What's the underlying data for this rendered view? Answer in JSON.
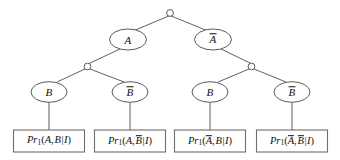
{
  "figure": {
    "kind": "probability-decomposition-tree",
    "background_color": "#ffffff",
    "line_color": "#4f4f4f",
    "text_color": "#111111"
  },
  "root": {
    "name": "root-junction",
    "label": ""
  },
  "level_a": {
    "nodes": [
      {
        "id": "node-a",
        "base": "A",
        "overbar": false
      },
      {
        "id": "node-a-bar",
        "base": "A",
        "overbar": true
      }
    ]
  },
  "junctions": [
    {
      "id": "junction-left"
    },
    {
      "id": "junction-right"
    }
  ],
  "level_b": {
    "nodes": [
      {
        "id": "node-b-1",
        "base": "B",
        "overbar": false
      },
      {
        "id": "node-b-2",
        "base": "B",
        "overbar": true
      },
      {
        "id": "node-b-3",
        "base": "B",
        "overbar": false
      },
      {
        "id": "node-b-4",
        "base": "B",
        "overbar": true
      }
    ]
  },
  "leaves": [
    {
      "id": "leaf-1",
      "function": "Pr",
      "subscript": "1",
      "arg_a": "A",
      "arg_a_overbar": false,
      "arg_b": "B",
      "arg_b_overbar": false,
      "conditional": "I",
      "full_text": "Pr1(A, B|I)"
    },
    {
      "id": "leaf-2",
      "function": "Pr",
      "subscript": "1",
      "arg_a": "A",
      "arg_a_overbar": false,
      "arg_b": "B",
      "arg_b_overbar": true,
      "conditional": "I",
      "full_text": "Pr1(A, B̄|I)"
    },
    {
      "id": "leaf-3",
      "function": "Pr",
      "subscript": "1",
      "arg_a": "A",
      "arg_a_overbar": true,
      "arg_b": "B",
      "arg_b_overbar": false,
      "conditional": "I",
      "full_text": "Pr1(Ā, B|I)"
    },
    {
      "id": "leaf-4",
      "function": "Pr",
      "subscript": "1",
      "arg_a": "A",
      "arg_a_overbar": true,
      "arg_b": "B",
      "arg_b_overbar": true,
      "conditional": "I",
      "full_text": "Pr1(Ā, B̄|I)"
    }
  ],
  "punctuation": {
    "open_paren": "(",
    "close_paren": ")",
    "comma": ",",
    "conditional_bar": "|"
  }
}
